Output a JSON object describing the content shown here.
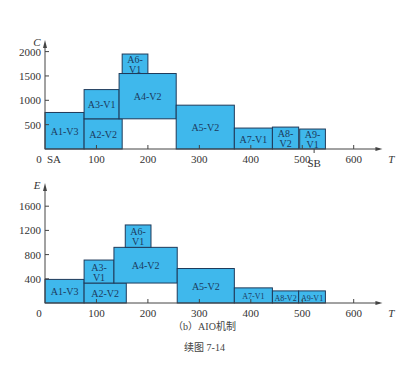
{
  "colors": {
    "fill": "#3fb8ec",
    "stroke": "#1f3a5a",
    "axis": "#444444"
  },
  "caption": {
    "sub": "（b）AIO机制",
    "figure": "续图 7-14"
  },
  "chart_data": [
    {
      "type": "bar",
      "subtype": "gantt-stacked-blocks",
      "title": "",
      "xlabel": "T",
      "ylabel": "C",
      "xlim": [
        0,
        650
      ],
      "ylim": [
        0,
        2100
      ],
      "xticks": [
        0,
        100,
        200,
        300,
        400,
        500,
        600
      ],
      "yticks": [
        500,
        1000,
        1500,
        2000
      ],
      "markers": [
        {
          "label": "SA",
          "x": 0
        },
        {
          "label": "SB",
          "x": 525
        }
      ],
      "grid": false,
      "blocks": [
        {
          "label": "A1-V3",
          "x0": 0,
          "x1": 76,
          "y0": 0,
          "y1": 750
        },
        {
          "label": "A2-V2",
          "x0": 76,
          "x1": 150,
          "y0": 0,
          "y1": 620
        },
        {
          "label": "A3-V1",
          "x0": 76,
          "x1": 144,
          "y0": 620,
          "y1": 1220
        },
        {
          "label": "A4-V2",
          "x0": 144,
          "x1": 255,
          "y0": 620,
          "y1": 1550
        },
        {
          "label": "A6-V1",
          "x0": 150,
          "x1": 200,
          "y0": 1550,
          "y1": 1950
        },
        {
          "label": "A5-V2",
          "x0": 255,
          "x1": 368,
          "y0": 0,
          "y1": 900
        },
        {
          "label": "A7-V1",
          "x0": 368,
          "x1": 442,
          "y0": 0,
          "y1": 430
        },
        {
          "label": "A8-V2",
          "x0": 442,
          "x1": 493,
          "y0": 0,
          "y1": 450
        },
        {
          "label": "A9-V1",
          "x0": 495,
          "x1": 545,
          "y0": 0,
          "y1": 410
        }
      ]
    },
    {
      "type": "bar",
      "subtype": "gantt-stacked-blocks",
      "title": "",
      "xlabel": "T",
      "ylabel": "E",
      "xlim": [
        0,
        650
      ],
      "ylim": [
        0,
        1800
      ],
      "xticks": [
        0,
        100,
        200,
        300,
        400,
        500,
        600
      ],
      "yticks": [
        400,
        800,
        1200,
        1600
      ],
      "grid": false,
      "blocks": [
        {
          "label": "A1-V3",
          "x0": 0,
          "x1": 76,
          "y0": 0,
          "y1": 390
        },
        {
          "label": "A2-V2",
          "x0": 76,
          "x1": 158,
          "y0": 0,
          "y1": 330
        },
        {
          "label": "A3-V1",
          "x0": 76,
          "x1": 134,
          "y0": 330,
          "y1": 710
        },
        {
          "label": "A4-V2",
          "x0": 134,
          "x1": 257,
          "y0": 330,
          "y1": 920
        },
        {
          "label": "A6-V1",
          "x0": 156,
          "x1": 206,
          "y0": 920,
          "y1": 1290
        },
        {
          "label": "A5-V2",
          "x0": 257,
          "x1": 368,
          "y0": 0,
          "y1": 570
        },
        {
          "label": "A7-V1",
          "x0": 368,
          "x1": 442,
          "y0": 0,
          "y1": 250
        },
        {
          "label": "A8-V2",
          "x0": 442,
          "x1": 493,
          "y0": 0,
          "y1": 200
        },
        {
          "label": "A9-V1",
          "x0": 493,
          "x1": 545,
          "y0": 0,
          "y1": 200
        }
      ]
    }
  ]
}
